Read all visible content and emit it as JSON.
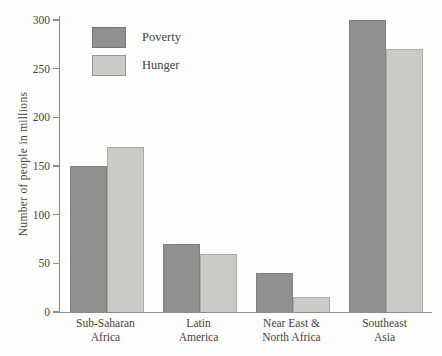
{
  "figure": {
    "background": "#fdfdfb",
    "axis_color": "#8b8b87",
    "text_color": "#45433f"
  },
  "chart_data": {
    "type": "bar",
    "title": "",
    "xlabel": "",
    "ylabel": "Number of people in millions",
    "ylim": [
      0,
      300
    ],
    "yticks": [
      0,
      50,
      100,
      150,
      200,
      250,
      300
    ],
    "grid": false,
    "legend_position": "top-left-inside",
    "categories": [
      "Sub-Saharan Africa",
      "Latin America",
      "Near East & North Africa",
      "Southeast Asia"
    ],
    "category_lines": [
      [
        "Sub-Saharan",
        "Africa"
      ],
      [
        "Latin",
        "America"
      ],
      [
        "Near East &",
        "North Africa"
      ],
      [
        "Southeast",
        "Asia"
      ]
    ],
    "series": [
      {
        "name": "Poverty",
        "color": "#8f918e",
        "values": [
          150,
          70,
          40,
          300
        ]
      },
      {
        "name": "Hunger",
        "color": "#c9ccc5",
        "values": [
          170,
          60,
          15,
          270
        ]
      }
    ]
  }
}
